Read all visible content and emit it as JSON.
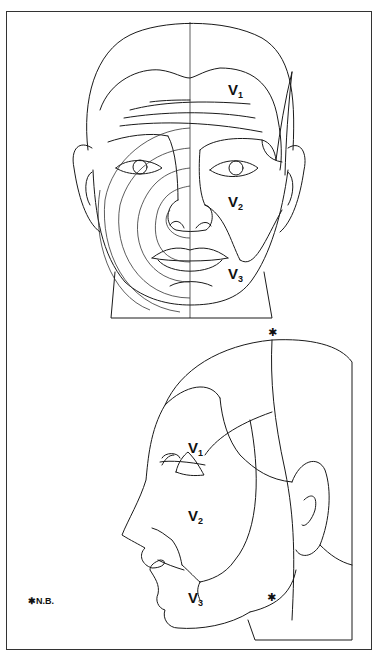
{
  "figure": {
    "panels": [
      {
        "id": "frontal-view",
        "labels": [
          {
            "base": "V",
            "sub": "1"
          },
          {
            "base": "V",
            "sub": "2"
          },
          {
            "base": "V",
            "sub": "3"
          }
        ]
      },
      {
        "id": "lateral-view",
        "labels": [
          {
            "base": "V",
            "sub": "1"
          },
          {
            "base": "V",
            "sub": "2"
          },
          {
            "base": "V",
            "sub": "3"
          }
        ],
        "markers": [
          "✱",
          "✱"
        ]
      }
    ],
    "legend": {
      "symbol": "✱",
      "text": "N.B."
    }
  }
}
